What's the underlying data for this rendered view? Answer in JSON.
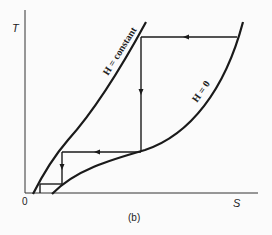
{
  "diagram": {
    "type": "T-S diagram (cooling cycle / magnetic refrigeration)",
    "axes": {
      "y_label": "T",
      "x_label": "S",
      "origin_label": "0"
    },
    "curves": [
      {
        "name": "H = constant",
        "label": "H = constant"
      },
      {
        "name": "H = 0",
        "label": "H = 0"
      }
    ],
    "caption": "(b)",
    "colors": {
      "line": "#1a1a1a",
      "background": "#fbfbfb"
    }
  }
}
